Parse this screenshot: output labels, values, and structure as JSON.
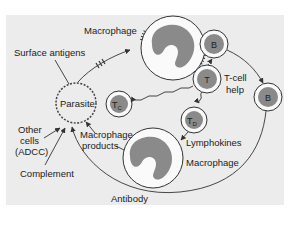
{
  "colors": {
    "background": "#ffffff",
    "panel": "#ececec",
    "nucleus": "#8a8a8a",
    "line": "#333333"
  },
  "labels": {
    "macrophage_top": "Macrophage",
    "surface_antigens": "Surface antigens",
    "parasite": "Parasite",
    "other_cells_1": "Other",
    "other_cells_2": "cells",
    "other_cells_3": "(ADCC)",
    "complement": "Complement",
    "macrophage_products_1": "Macrophage",
    "macrophage_products_2": "products",
    "antibody": "Antibody",
    "tcell_help_1": "T-cell",
    "tcell_help_2": "help",
    "lymphokines": "Lymphokines",
    "macrophage_bottom": "Macrophage"
  },
  "cells": {
    "b_top": "B",
    "t_helper": "T",
    "b_right": "B",
    "tc_main": "T",
    "tc_sub": "C",
    "td_main": "T",
    "td_sub": "D"
  }
}
